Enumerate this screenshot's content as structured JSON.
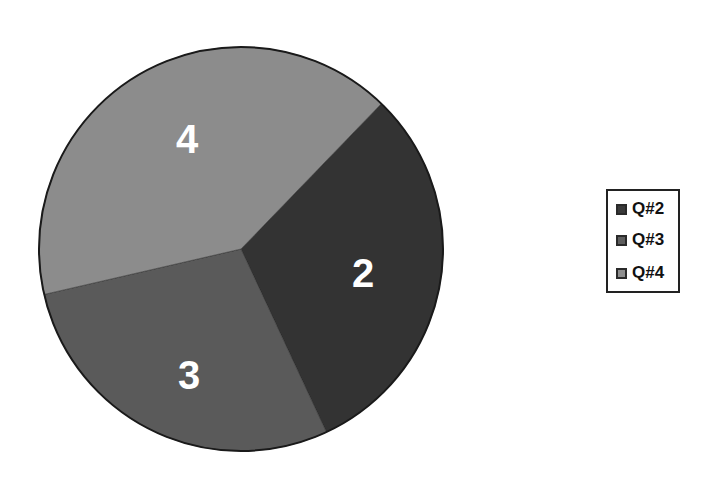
{
  "chart_data": {
    "type": "pie",
    "title": "",
    "categories": [
      "Q#2",
      "Q#3",
      "Q#4"
    ],
    "values": [
      2,
      3,
      4
    ],
    "slice_labels": [
      "2",
      "3",
      "4"
    ],
    "colors": [
      "#333333",
      "#5a5a5a",
      "#8c8c8c"
    ],
    "legend_position": "right"
  },
  "legend": {
    "items": [
      {
        "label": "Q#2",
        "color": "#3a3a3a"
      },
      {
        "label": "Q#3",
        "color": "#5e5e5e"
      },
      {
        "label": "Q#4",
        "color": "#8e8e8e"
      }
    ]
  }
}
